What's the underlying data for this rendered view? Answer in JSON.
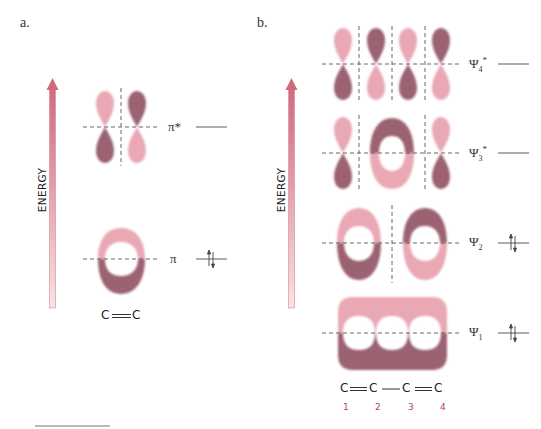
{
  "panels": {
    "a": {
      "label": "a.",
      "energy_axis_label": "ENERGY",
      "levels": [
        {
          "name": "pi-star",
          "label": "π*",
          "electrons": 0
        },
        {
          "name": "pi",
          "label": "π",
          "electrons": 2
        }
      ],
      "molecule": "C═C"
    },
    "b": {
      "label": "b.",
      "energy_axis_label": "ENERGY",
      "levels": [
        {
          "name": "psi4-star",
          "symbol": "Ψ",
          "sub": "4",
          "sup": "*",
          "electrons": 0
        },
        {
          "name": "psi3-star",
          "symbol": "Ψ",
          "sub": "3",
          "sup": "*",
          "electrons": 0
        },
        {
          "name": "psi2",
          "symbol": "Ψ",
          "sub": "2",
          "sup": "",
          "electrons": 2
        },
        {
          "name": "psi1",
          "symbol": "Ψ",
          "sub": "1",
          "sup": "",
          "electrons": 2
        }
      ],
      "molecule": {
        "atoms": [
          "C",
          "C",
          "C",
          "C"
        ],
        "bonds": [
          "double",
          "single",
          "double"
        ],
        "atom_numbers": [
          "1",
          "2",
          "3",
          "4"
        ]
      }
    }
  },
  "colors": {
    "lobe_light": "#e9a8b3",
    "lobe_dark": "#9b6272",
    "arrow_top": "#cf6a7c",
    "arrow_bottom": "#f6dde2",
    "node_line": "#666666",
    "atom_number": "#b0445e"
  }
}
